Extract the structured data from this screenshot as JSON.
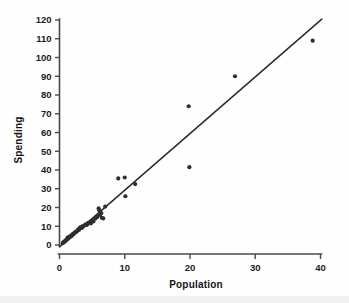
{
  "chart_data": {
    "type": "scatter",
    "title": "",
    "subtitle": "",
    "xlabel": "Population",
    "ylabel": "Spending",
    "xlim": [
      0,
      41.5
    ],
    "ylim": [
      -2,
      122
    ],
    "xticks": [
      0,
      10,
      20,
      30,
      40
    ],
    "xticklabels": [
      "0",
      "10",
      "20",
      "30",
      "40"
    ],
    "yticks": [
      0,
      10,
      20,
      30,
      40,
      50,
      60,
      70,
      80,
      90,
      100,
      110,
      120
    ],
    "yticklabels": [
      "0",
      "10",
      "20",
      "30",
      "40",
      "50",
      "60",
      "70",
      "80",
      "90",
      "100",
      "110",
      "120"
    ],
    "grid": false,
    "legend": null,
    "legend_position": "none",
    "marker": "filled-circle",
    "marker_size": 2.1,
    "point_color": "#2e2e2e",
    "line_color": "#2b2b2b",
    "axis_color": "#4a4a4a",
    "background_color": "#fefefe",
    "points": [
      {
        "x": 0.5,
        "y": 1.0
      },
      {
        "x": 0.6,
        "y": 1.4
      },
      {
        "x": 0.7,
        "y": 1.6
      },
      {
        "x": 0.8,
        "y": 2.0
      },
      {
        "x": 0.9,
        "y": 2.2
      },
      {
        "x": 1.0,
        "y": 2.6
      },
      {
        "x": 1.1,
        "y": 2.9
      },
      {
        "x": 1.2,
        "y": 3.2
      },
      {
        "x": 1.25,
        "y": 3.9
      },
      {
        "x": 1.3,
        "y": 3.4
      },
      {
        "x": 1.4,
        "y": 4.1
      },
      {
        "x": 1.5,
        "y": 4.0
      },
      {
        "x": 1.6,
        "y": 4.6
      },
      {
        "x": 1.7,
        "y": 4.4
      },
      {
        "x": 1.8,
        "y": 5.2
      },
      {
        "x": 1.9,
        "y": 5.0
      },
      {
        "x": 2.0,
        "y": 5.6
      },
      {
        "x": 2.1,
        "y": 6.1
      },
      {
        "x": 2.2,
        "y": 5.9
      },
      {
        "x": 2.4,
        "y": 6.8
      },
      {
        "x": 2.5,
        "y": 7.2
      },
      {
        "x": 2.6,
        "y": 7.0
      },
      {
        "x": 2.8,
        "y": 7.9
      },
      {
        "x": 2.9,
        "y": 8.4
      },
      {
        "x": 3.0,
        "y": 8.1
      },
      {
        "x": 3.1,
        "y": 9.0
      },
      {
        "x": 3.2,
        "y": 9.4
      },
      {
        "x": 3.4,
        "y": 9.1
      },
      {
        "x": 3.5,
        "y": 10.0
      },
      {
        "x": 3.6,
        "y": 9.8
      },
      {
        "x": 3.8,
        "y": 10.4
      },
      {
        "x": 4.0,
        "y": 11.0
      },
      {
        "x": 4.2,
        "y": 10.7
      },
      {
        "x": 4.4,
        "y": 11.8
      },
      {
        "x": 4.6,
        "y": 12.0
      },
      {
        "x": 4.8,
        "y": 11.5
      },
      {
        "x": 5.0,
        "y": 13.0
      },
      {
        "x": 5.2,
        "y": 12.6
      },
      {
        "x": 5.5,
        "y": 14.2
      },
      {
        "x": 5.8,
        "y": 15.0
      },
      {
        "x": 6.0,
        "y": 19.5
      },
      {
        "x": 6.1,
        "y": 18.5
      },
      {
        "x": 6.2,
        "y": 16.0
      },
      {
        "x": 6.4,
        "y": 17.0
      },
      {
        "x": 6.5,
        "y": 14.5
      },
      {
        "x": 6.7,
        "y": 14.2
      },
      {
        "x": 7.0,
        "y": 20.5
      },
      {
        "x": 9.0,
        "y": 35.5
      },
      {
        "x": 10.0,
        "y": 36.0
      },
      {
        "x": 10.1,
        "y": 26.0
      },
      {
        "x": 11.6,
        "y": 32.5
      },
      {
        "x": 19.8,
        "y": 74.0
      },
      {
        "x": 19.9,
        "y": 41.5
      },
      {
        "x": 26.9,
        "y": 90.0
      },
      {
        "x": 38.8,
        "y": 109.0
      }
    ],
    "fit_line": {
      "name": "regression-line",
      "x_start": 0.0,
      "y_start": -1.0,
      "x_end": 40.2,
      "y_end": 120.5,
      "slope": 3.02,
      "intercept": -1.0
    }
  }
}
